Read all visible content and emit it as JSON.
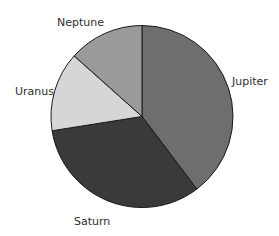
{
  "chart_data": {
    "type": "pie",
    "title": "",
    "start_angle_deg": 0,
    "direction": "clockwise",
    "categories": [
      "Jupiter",
      "Saturn",
      "Uranus",
      "Neptune"
    ],
    "values": [
      39.7,
      32.8,
      14.1,
      13.4
    ],
    "colors": [
      "#6e6e6e",
      "#3a3a3a",
      "#d6d6d6",
      "#9a9a9a"
    ],
    "legend": "none",
    "labels_outside": true
  },
  "labels": {
    "jupiter": "Jupiter",
    "saturn": "Saturn",
    "uranus": "Uranus",
    "neptune": "Neptune"
  }
}
